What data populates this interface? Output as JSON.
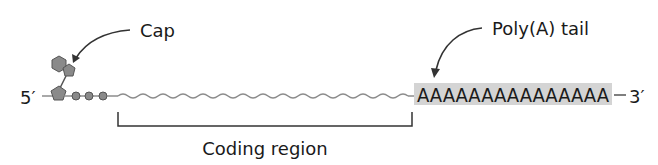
{
  "diagram": {
    "labels": {
      "cap": "Cap",
      "polya": "Poly(A) tail",
      "five_prime": "5′",
      "three_prime": "3′",
      "coding_region": "Coding region",
      "polya_sequence": "AAAAAAAAAAAAAAA"
    },
    "colors": {
      "cap_fill": "#8a8a8a",
      "strand": "#8c8c8c",
      "polya_bg": "#d4d4d4",
      "text": "#1a1a1a"
    },
    "polya_count": 15,
    "phosphate_count": 3
  }
}
